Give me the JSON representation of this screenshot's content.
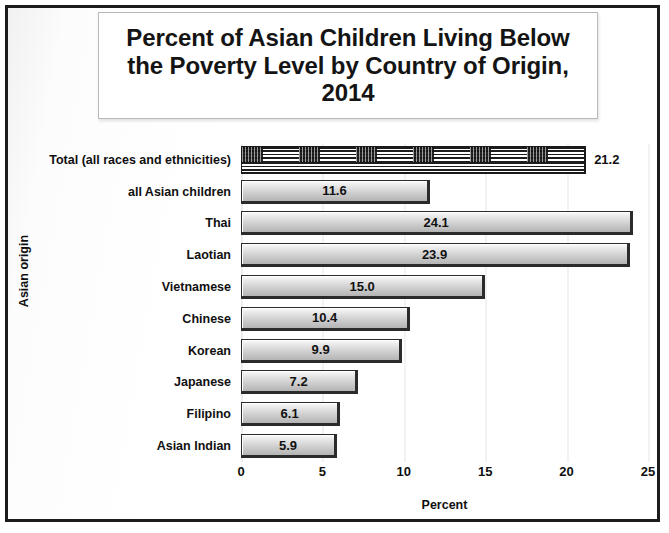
{
  "chart_data": {
    "type": "bar",
    "orientation": "horizontal",
    "title": "Percent of Asian Children Living Below the Poverty Level by Country of Origin, 2014",
    "xlabel": "Percent",
    "ylabel": "Asian origin",
    "xlim": [
      0,
      25
    ],
    "xticks": [
      "0",
      "5",
      "10",
      "15",
      "20",
      "25"
    ],
    "grid": true,
    "legend": false,
    "categories": [
      "Total (all races and ethnicities)",
      "all Asian children",
      "Thai",
      "Laotian",
      "Vietnamese",
      "Chinese",
      "Korean",
      "Japanese",
      "Filipino",
      "Asian Indian"
    ],
    "values": [
      21.2,
      11.6,
      24.1,
      23.9,
      15.0,
      10.4,
      9.9,
      7.2,
      6.1,
      5.9
    ],
    "value_labels": [
      "21.2",
      "11.6",
      "24.1",
      "23.9",
      "15.0",
      "10.4",
      "9.9",
      "7.2",
      "6.1",
      "5.9"
    ],
    "label_positions": [
      "outside",
      "inside",
      "inside",
      "inside",
      "inside",
      "inside",
      "inside",
      "inside",
      "inside",
      "inside"
    ],
    "bar_styles": [
      "flag",
      "gray",
      "gray",
      "gray",
      "gray",
      "gray",
      "gray",
      "gray",
      "gray",
      "gray"
    ]
  },
  "colors": {
    "frame": "#1c1c1c",
    "bar_fill_light": "#fcfcfc",
    "bar_fill_dark": "#b4b4b4",
    "bar_border": "#2b2b2b",
    "gridline": "#f2f2f2",
    "text": "#111111",
    "background": "#ffffff"
  }
}
